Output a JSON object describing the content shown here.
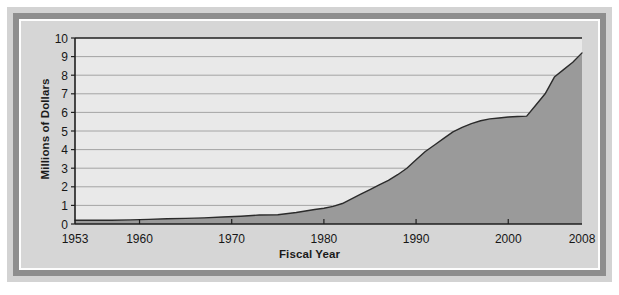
{
  "chart_data": {
    "type": "area",
    "title": "",
    "xlabel": "Fiscal Year",
    "ylabel": "Millions of Dollars",
    "xlim": [
      1953,
      2008
    ],
    "ylim": [
      0,
      10
    ],
    "grid": true,
    "legend": "none",
    "x_ticks": [
      "1953",
      "1960",
      "1970",
      "1980",
      "1990",
      "2000",
      "2008"
    ],
    "x_tick_values": [
      1953,
      1960,
      1970,
      1980,
      1990,
      2000,
      2008
    ],
    "y_ticks": [
      "0",
      "1",
      "2",
      "3",
      "4",
      "5",
      "6",
      "7",
      "8",
      "9",
      "10"
    ],
    "y_tick_values": [
      0,
      1,
      2,
      3,
      4,
      5,
      6,
      7,
      8,
      9,
      10
    ],
    "series_name": "Appropriations",
    "x": [
      1953,
      1955,
      1957,
      1959,
      1961,
      1963,
      1965,
      1967,
      1969,
      1971,
      1973,
      1975,
      1977,
      1979,
      1980,
      1981,
      1982,
      1983,
      1984,
      1985,
      1986,
      1987,
      1988,
      1989,
      1990,
      1991,
      1992,
      1993,
      1994,
      1995,
      1996,
      1997,
      1998,
      1999,
      2000,
      2001,
      2002,
      2003,
      2004,
      2005,
      2006,
      2007,
      2008
    ],
    "values": [
      0.2,
      0.2,
      0.2,
      0.22,
      0.25,
      0.28,
      0.3,
      0.33,
      0.38,
      0.42,
      0.48,
      0.5,
      0.62,
      0.78,
      0.85,
      0.95,
      1.1,
      1.35,
      1.6,
      1.85,
      2.1,
      2.35,
      2.65,
      3.0,
      3.45,
      3.9,
      4.25,
      4.6,
      4.95,
      5.2,
      5.4,
      5.55,
      5.65,
      5.7,
      5.75,
      5.78,
      5.8,
      6.4,
      7.0,
      7.9,
      8.3,
      8.7,
      9.2
    ],
    "colors": {
      "area_fill": "#9a9a9a",
      "area_line": "#2b2b2b",
      "plot_background": "#e9e9e9",
      "gridline": "#9c9c9c",
      "axis": "#1f1f1f",
      "figure_background": "#d6d6d6",
      "frame": "#8e8e8e",
      "outer_margin": "#d3d3d3"
    }
  }
}
